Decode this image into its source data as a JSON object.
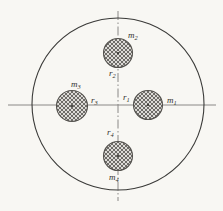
{
  "figure": {
    "background_color": "#f8f7f3",
    "line_color": "#3a3a38",
    "axis_color": "#8a8886",
    "hatch_color": "#55534f",
    "hatch_fill": "#d8d6d2",
    "disk": {
      "name": "rotor-disk",
      "cx": 118,
      "cy": 104,
      "r": 86,
      "stroke_width": 1.1,
      "fill": "none"
    },
    "axes": {
      "horizontal": {
        "name": "horizontal-axis",
        "x1": 8,
        "y1": 105,
        "x2": 216,
        "y2": 105,
        "style": "solid"
      },
      "vertical": {
        "name": "vertical-centerline",
        "x1": 118,
        "y1": 11,
        "x2": 118,
        "y2": 201,
        "style": "dash-dot"
      }
    },
    "masses": [
      {
        "id": "mass-1",
        "position": "east",
        "cx": 148,
        "cy": 105,
        "r": 14.5,
        "mass_label": "m",
        "mass_sub": "1",
        "mass_label_x": 167,
        "mass_label_y": 101,
        "radius_label": "r",
        "radius_sub": "1",
        "radius_label_x": 123,
        "radius_label_y": 98
      },
      {
        "id": "mass-2",
        "position": "north",
        "cx": 118,
        "cy": 53,
        "r": 14.5,
        "mass_label": "m",
        "mass_sub": "2",
        "mass_label_x": 128,
        "mass_label_y": 36,
        "radius_label": "r",
        "radius_sub": "2",
        "radius_label_x": 109,
        "radius_label_y": 74
      },
      {
        "id": "mass-3",
        "position": "west",
        "cx": 72,
        "cy": 106,
        "r": 15.5,
        "mass_label": "m",
        "mass_sub": "3",
        "mass_label_x": 71,
        "mass_label_y": 85,
        "radius_label": "r",
        "radius_sub": "3",
        "radius_label_x": 91,
        "radius_label_y": 101
      },
      {
        "id": "mass-4",
        "position": "south",
        "cx": 118,
        "cy": 156,
        "r": 14.5,
        "mass_label": "m",
        "mass_sub": "4",
        "mass_label_x": 109,
        "mass_label_y": 178,
        "radius_label": "r",
        "radius_sub": "4",
        "radius_label_x": 107,
        "radius_label_y": 133
      }
    ]
  }
}
